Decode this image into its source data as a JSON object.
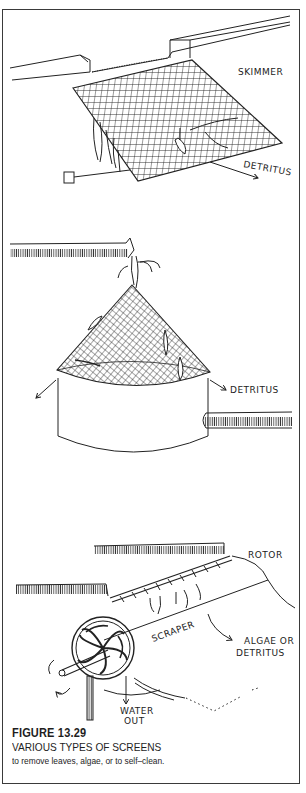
{
  "figure": {
    "number": "FIGURE 13.29",
    "title": "VARIOUS TYPES OF SCREENS",
    "subtitle": "to remove leaves, algae, or to self–clean."
  },
  "illustrations": {
    "skimmer": {
      "label": "SKIMMER",
      "detritus_label": "DETRITUS"
    },
    "cone_screen": {
      "detritus_label": "DETRITUS"
    },
    "rotor_screen": {
      "rotor_label": "ROTOR",
      "scraper_label": "SCRAPER",
      "output_label_line1": "ALGAE OR",
      "output_label_line2": "DETRITUS",
      "water_label_line1": "WATER",
      "water_label_line2": "OUT"
    }
  },
  "colors": {
    "ink": "#222222",
    "paper": "#ffffff",
    "frame": "#3a3a3a"
  }
}
